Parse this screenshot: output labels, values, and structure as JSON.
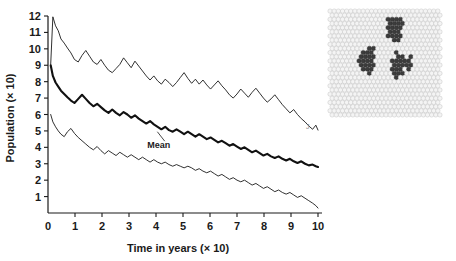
{
  "figure": {
    "background": "#ffffff",
    "ink": "#1a1a1a"
  },
  "chart_data": {
    "type": "line",
    "title": "",
    "xlabel": "Time in years (× 10)",
    "ylabel": "Population (× 10)",
    "xlim": [
      0,
      10
    ],
    "ylim": [
      0,
      12
    ],
    "xticks": [
      "0",
      "1",
      "2",
      "3",
      "4",
      "5",
      "6",
      "7",
      "8",
      "9",
      "10"
    ],
    "yticks": [
      "1",
      "2",
      "3",
      "4",
      "5",
      "6",
      "7",
      "8",
      "9",
      "10",
      "11",
      "12"
    ],
    "grid": false,
    "legend_position": "none",
    "annotations": [
      {
        "text": "Mean",
        "x": 4.1,
        "y": 3.95,
        "target_x": 4.05,
        "target_y": 4.95
      }
    ],
    "series": [
      {
        "name": "upper",
        "style": "thin",
        "color": "#1a1a1a",
        "width": 0.9,
        "x": [
          0.1,
          0.18,
          0.28,
          0.38,
          0.48,
          0.6,
          0.72,
          0.85,
          0.98,
          1.12,
          1.26,
          1.4,
          1.54,
          1.68,
          1.82,
          1.96,
          2.1,
          2.24,
          2.38,
          2.52,
          2.66,
          2.8,
          2.94,
          3.08,
          3.22,
          3.36,
          3.5,
          3.64,
          3.78,
          3.92,
          4.06,
          4.2,
          4.34,
          4.48,
          4.62,
          4.76,
          4.9,
          5.04,
          5.18,
          5.32,
          5.46,
          5.6,
          5.74,
          5.88,
          6.02,
          6.16,
          6.3,
          6.44,
          6.58,
          6.72,
          6.86,
          7.0,
          7.14,
          7.28,
          7.42,
          7.56,
          7.7,
          7.84,
          7.98,
          8.12,
          8.26,
          8.4,
          8.54,
          8.68,
          8.82,
          8.96,
          9.1,
          9.24,
          9.38,
          9.52,
          9.66,
          9.8,
          9.92,
          10.0
        ],
        "y": [
          9.05,
          11.95,
          11.4,
          11.1,
          10.6,
          10.35,
          10.05,
          9.75,
          9.35,
          9.2,
          9.6,
          9.9,
          9.55,
          9.2,
          9.05,
          9.35,
          9.0,
          8.7,
          8.55,
          8.8,
          9.05,
          9.45,
          9.15,
          8.85,
          9.25,
          8.95,
          8.65,
          8.35,
          8.1,
          8.35,
          8.05,
          7.85,
          8.15,
          7.95,
          7.7,
          7.95,
          8.25,
          8.55,
          8.2,
          7.9,
          8.15,
          7.85,
          8.1,
          7.8,
          7.55,
          7.8,
          8.05,
          7.75,
          7.5,
          7.2,
          7.0,
          7.25,
          7.55,
          7.3,
          7.05,
          7.35,
          7.6,
          7.3,
          7.0,
          6.75,
          6.95,
          7.2,
          6.9,
          6.6,
          6.35,
          6.1,
          6.3,
          6.0,
          5.75,
          5.55,
          5.3,
          5.1,
          5.35,
          5.05
        ]
      },
      {
        "name": "mean",
        "style": "thick",
        "color": "#111111",
        "width": 2.1,
        "x": [
          0.1,
          0.18,
          0.28,
          0.38,
          0.48,
          0.6,
          0.72,
          0.85,
          0.98,
          1.12,
          1.26,
          1.4,
          1.54,
          1.68,
          1.82,
          1.96,
          2.1,
          2.24,
          2.38,
          2.52,
          2.66,
          2.8,
          2.94,
          3.08,
          3.22,
          3.36,
          3.5,
          3.64,
          3.78,
          3.92,
          4.06,
          4.2,
          4.34,
          4.48,
          4.62,
          4.76,
          4.9,
          5.04,
          5.18,
          5.32,
          5.46,
          5.6,
          5.74,
          5.88,
          6.02,
          6.16,
          6.3,
          6.44,
          6.58,
          6.72,
          6.86,
          7.0,
          7.14,
          7.28,
          7.42,
          7.56,
          7.7,
          7.84,
          7.98,
          8.12,
          8.26,
          8.4,
          8.54,
          8.68,
          8.82,
          8.96,
          9.1,
          9.24,
          9.38,
          9.52,
          9.66,
          9.8,
          9.92,
          10.0
        ],
        "y": [
          9.0,
          8.35,
          7.95,
          7.7,
          7.45,
          7.25,
          7.05,
          6.85,
          6.7,
          6.95,
          7.2,
          6.95,
          6.7,
          6.5,
          6.65,
          6.45,
          6.25,
          6.1,
          6.3,
          6.1,
          5.95,
          6.15,
          6.0,
          5.8,
          5.95,
          5.75,
          5.6,
          5.45,
          5.6,
          5.4,
          5.25,
          5.1,
          5.25,
          5.05,
          4.95,
          5.1,
          4.95,
          4.8,
          4.95,
          4.8,
          4.65,
          4.8,
          4.65,
          4.5,
          4.6,
          4.45,
          4.3,
          4.4,
          4.25,
          4.1,
          4.2,
          4.05,
          3.9,
          4.0,
          3.85,
          3.7,
          3.8,
          3.65,
          3.5,
          3.6,
          3.45,
          3.35,
          3.45,
          3.3,
          3.2,
          3.3,
          3.15,
          3.05,
          3.15,
          3.0,
          2.9,
          2.95,
          2.85,
          2.8
        ]
      },
      {
        "name": "lower",
        "style": "thin",
        "color": "#1a1a1a",
        "width": 0.9,
        "x": [
          0.1,
          0.18,
          0.28,
          0.38,
          0.48,
          0.6,
          0.72,
          0.85,
          0.98,
          1.12,
          1.26,
          1.4,
          1.54,
          1.68,
          1.82,
          1.96,
          2.1,
          2.24,
          2.38,
          2.52,
          2.66,
          2.8,
          2.94,
          3.08,
          3.22,
          3.36,
          3.5,
          3.64,
          3.78,
          3.92,
          4.06,
          4.2,
          4.34,
          4.48,
          4.62,
          4.76,
          4.9,
          5.04,
          5.18,
          5.32,
          5.46,
          5.6,
          5.74,
          5.88,
          6.02,
          6.16,
          6.3,
          6.44,
          6.58,
          6.72,
          6.86,
          7.0,
          7.14,
          7.28,
          7.42,
          7.56,
          7.7,
          7.84,
          7.98,
          8.12,
          8.26,
          8.4,
          8.54,
          8.68,
          8.82,
          8.96,
          9.1,
          9.24,
          9.38,
          9.52,
          9.66,
          9.8,
          9.92,
          10.0
        ],
        "y": [
          6.0,
          5.55,
          5.25,
          5.0,
          4.8,
          4.65,
          4.95,
          5.15,
          4.85,
          4.6,
          4.4,
          4.2,
          4.0,
          3.85,
          4.05,
          3.8,
          3.6,
          3.8,
          3.65,
          3.5,
          3.7,
          3.55,
          3.4,
          3.55,
          3.4,
          3.25,
          3.4,
          3.25,
          3.1,
          3.25,
          3.1,
          3.0,
          3.1,
          2.95,
          2.85,
          2.95,
          2.85,
          2.75,
          2.85,
          2.75,
          2.6,
          2.7,
          2.55,
          2.45,
          2.55,
          2.4,
          2.25,
          2.35,
          2.2,
          2.05,
          2.15,
          2.0,
          1.9,
          2.0,
          1.85,
          1.7,
          1.8,
          1.65,
          1.5,
          1.6,
          1.45,
          1.3,
          1.4,
          1.25,
          1.15,
          1.25,
          1.1,
          0.95,
          1.05,
          0.9,
          0.75,
          0.6,
          0.45,
          0.3
        ]
      }
    ]
  },
  "inset": {
    "name": "hexagonal-lattice-inset",
    "cell_fill": "#f4f4f4",
    "cell_stroke": "#b8b8b8",
    "occupied_fill": "#3c3c3c",
    "occupied_stroke": "#2a2a2a",
    "rows": 26,
    "cols": 27,
    "clusters": [
      {
        "label": "cluster-top",
        "cells": [
          [
            5,
            15
          ],
          [
            5,
            16
          ],
          [
            4,
            15
          ],
          [
            4,
            16
          ],
          [
            4,
            17
          ],
          [
            3,
            14
          ],
          [
            3,
            15
          ],
          [
            3,
            16
          ],
          [
            3,
            17
          ],
          [
            2,
            14
          ],
          [
            2,
            15
          ],
          [
            2,
            16
          ],
          [
            6,
            15
          ],
          [
            6,
            16
          ],
          [
            6,
            17
          ],
          [
            7,
            16
          ],
          [
            2,
            17
          ],
          [
            5,
            14
          ],
          [
            6,
            14
          ],
          [
            4,
            14
          ],
          [
            7,
            15
          ]
        ]
      },
      {
        "label": "cluster-left",
        "cells": [
          [
            10,
            8
          ],
          [
            10,
            9
          ],
          [
            11,
            8
          ],
          [
            11,
            9
          ],
          [
            11,
            10
          ],
          [
            12,
            7
          ],
          [
            12,
            8
          ],
          [
            12,
            9
          ],
          [
            13,
            8
          ],
          [
            13,
            9
          ],
          [
            13,
            10
          ],
          [
            14,
            8
          ],
          [
            14,
            9
          ],
          [
            9,
            9
          ],
          [
            9,
            10
          ],
          [
            10,
            10
          ],
          [
            12,
            10
          ],
          [
            14,
            10
          ],
          [
            15,
            9
          ],
          [
            11,
            7
          ],
          [
            13,
            7
          ]
        ]
      },
      {
        "label": "cluster-right",
        "cells": [
          [
            11,
            16
          ],
          [
            11,
            17
          ],
          [
            12,
            16
          ],
          [
            12,
            17
          ],
          [
            12,
            18
          ],
          [
            13,
            15
          ],
          [
            13,
            16
          ],
          [
            13,
            17
          ],
          [
            13,
            18
          ],
          [
            14,
            16
          ],
          [
            14,
            17
          ],
          [
            15,
            16
          ],
          [
            15,
            17
          ],
          [
            11,
            19
          ],
          [
            12,
            19
          ],
          [
            13,
            19
          ],
          [
            10,
            16
          ],
          [
            14,
            15
          ],
          [
            15,
            15
          ],
          [
            16,
            16
          ],
          [
            14,
            19
          ],
          [
            12,
            15
          ]
        ]
      }
    ]
  },
  "corner_mark": "J"
}
